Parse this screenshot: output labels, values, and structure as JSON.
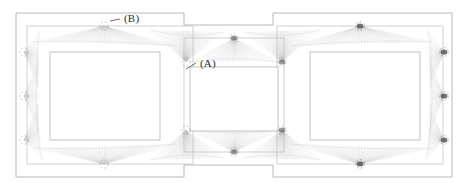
{
  "figure": {
    "type": "plan-diagram",
    "width": 468,
    "height": 192,
    "background_color": "#ffffff",
    "line_color": "#9a9a9a",
    "fan_color": "#8c8c90",
    "node_color": "#4a4a4a",
    "label_color": "#2b2b2b"
  },
  "labels": [
    {
      "id": "A",
      "text": "(A)",
      "x": 200,
      "y": 58,
      "leader_from": [
        196,
        63
      ],
      "leader_to": [
        186,
        69
      ]
    },
    {
      "id": "B",
      "text": "(B)",
      "x": 124,
      "y": 13,
      "leader_from": [
        120,
        19
      ],
      "leader_to": [
        110,
        21
      ]
    }
  ],
  "outline": {
    "name": "outer-boundary",
    "stroke": "#b0b0b0",
    "points": [
      [
        16,
        13
      ],
      [
        184,
        13
      ],
      [
        184,
        25
      ],
      [
        273,
        25
      ],
      [
        273,
        13
      ],
      [
        452,
        13
      ],
      [
        452,
        177
      ],
      [
        273,
        177
      ],
      [
        273,
        165
      ],
      [
        184,
        165
      ],
      [
        184,
        177
      ],
      [
        16,
        177
      ]
    ]
  },
  "bays": [
    {
      "name": "left-bay-outline",
      "x": 27,
      "y": 26,
      "w": 166,
      "h": 138,
      "stroke": "#bcbcbc"
    },
    {
      "name": "center-bay-outline",
      "x": 184,
      "y": 38,
      "w": 100,
      "h": 114,
      "stroke": "#bcbcbc"
    },
    {
      "name": "right-bay-outline",
      "x": 277,
      "y": 26,
      "w": 166,
      "h": 138,
      "stroke": "#bcbcbc"
    }
  ],
  "inner_rectangles": [
    {
      "name": "left-core-rect",
      "x": 50,
      "y": 52,
      "w": 110,
      "h": 88,
      "stroke": "#b4b4b4"
    },
    {
      "name": "center-core-rect",
      "x": 190,
      "y": 67,
      "w": 88,
      "h": 64,
      "stroke": "#b4b4b4"
    },
    {
      "name": "right-core-rect",
      "x": 310,
      "y": 52,
      "w": 110,
      "h": 88,
      "stroke": "#b4b4b4"
    }
  ],
  "nodes": [
    {
      "id": "n-l-top",
      "x": 104,
      "y": 26,
      "marker": "dashed-circle",
      "weight": "light"
    },
    {
      "id": "n-l-bottom",
      "x": 104,
      "y": 164,
      "marker": "dashed-circle",
      "weight": "light"
    },
    {
      "id": "n-l-left-1",
      "x": 24,
      "y": 52,
      "marker": "dashed-circle",
      "weight": "light"
    },
    {
      "id": "n-l-left-2",
      "x": 24,
      "y": 96,
      "marker": "dashed-circle",
      "weight": "light"
    },
    {
      "id": "n-l-left-3",
      "x": 24,
      "y": 140,
      "marker": "dashed-circle",
      "weight": "light"
    },
    {
      "id": "n-l-tr",
      "x": 186,
      "y": 62,
      "marker": "dashed-circle",
      "weight": "light"
    },
    {
      "id": "n-l-br",
      "x": 186,
      "y": 130,
      "marker": "dashed-circle",
      "weight": "light"
    },
    {
      "id": "n-c-top",
      "x": 234,
      "y": 38,
      "marker": "solid-blob",
      "weight": "medium"
    },
    {
      "id": "n-c-bottom",
      "x": 234,
      "y": 152,
      "marker": "solid-blob",
      "weight": "medium"
    },
    {
      "id": "n-c-tr",
      "x": 282,
      "y": 62,
      "marker": "solid-blob",
      "weight": "medium"
    },
    {
      "id": "n-c-br",
      "x": 282,
      "y": 130,
      "marker": "solid-blob",
      "weight": "medium"
    },
    {
      "id": "n-r-top",
      "x": 360,
      "y": 26,
      "marker": "solid-blob",
      "weight": "dark"
    },
    {
      "id": "n-r-bottom",
      "x": 360,
      "y": 164,
      "marker": "solid-blob",
      "weight": "dark"
    },
    {
      "id": "n-r-right-1",
      "x": 444,
      "y": 52,
      "marker": "solid-blob",
      "weight": "dark"
    },
    {
      "id": "n-r-right-2",
      "x": 444,
      "y": 96,
      "marker": "solid-blob",
      "weight": "dark"
    },
    {
      "id": "n-r-right-3",
      "x": 444,
      "y": 140,
      "marker": "solid-blob",
      "weight": "dark"
    }
  ],
  "fans": [
    {
      "name": "fan-left-top",
      "apex": [
        104,
        26
      ],
      "spread_a": [
        34,
        42
      ],
      "spread_b": [
        176,
        46
      ],
      "rays": 46,
      "opacity": 0.5
    },
    {
      "name": "fan-left-bottom",
      "apex": [
        104,
        164
      ],
      "spread_a": [
        34,
        148
      ],
      "spread_b": [
        176,
        144
      ],
      "rays": 46,
      "opacity": 0.5
    },
    {
      "name": "fan-left-edge-1",
      "apex": [
        24,
        52
      ],
      "spread_a": [
        40,
        30
      ],
      "spread_b": [
        38,
        88
      ],
      "rays": 30,
      "opacity": 0.45
    },
    {
      "name": "fan-left-edge-2",
      "apex": [
        24,
        96
      ],
      "spread_a": [
        38,
        60
      ],
      "spread_b": [
        38,
        132
      ],
      "rays": 30,
      "opacity": 0.45
    },
    {
      "name": "fan-left-edge-3",
      "apex": [
        24,
        140
      ],
      "spread_a": [
        38,
        104
      ],
      "spread_b": [
        42,
        160
      ],
      "rays": 30,
      "opacity": 0.45
    },
    {
      "name": "fan-left-tr",
      "apex": [
        186,
        62
      ],
      "spread_a": [
        150,
        30
      ],
      "spread_b": [
        224,
        32
      ],
      "rays": 40,
      "opacity": 0.55
    },
    {
      "name": "fan-left-br",
      "apex": [
        186,
        130
      ],
      "spread_a": [
        150,
        160
      ],
      "spread_b": [
        224,
        158
      ],
      "rays": 40,
      "opacity": 0.55
    },
    {
      "name": "fan-center-top",
      "apex": [
        234,
        38
      ],
      "spread_a": [
        190,
        62
      ],
      "spread_b": [
        280,
        62
      ],
      "rays": 36,
      "opacity": 0.5
    },
    {
      "name": "fan-center-bottom",
      "apex": [
        234,
        152
      ],
      "spread_a": [
        190,
        130
      ],
      "spread_b": [
        280,
        130
      ],
      "rays": 36,
      "opacity": 0.5
    },
    {
      "name": "fan-center-tr",
      "apex": [
        282,
        62
      ],
      "spread_a": [
        244,
        32
      ],
      "spread_b": [
        320,
        30
      ],
      "rays": 40,
      "opacity": 0.55
    },
    {
      "name": "fan-center-br",
      "apex": [
        282,
        130
      ],
      "spread_a": [
        244,
        158
      ],
      "spread_b": [
        320,
        160
      ],
      "rays": 40,
      "opacity": 0.55
    },
    {
      "name": "fan-right-top",
      "apex": [
        360,
        26
      ],
      "spread_a": [
        292,
        46
      ],
      "spread_b": [
        432,
        42
      ],
      "rays": 46,
      "opacity": 0.5
    },
    {
      "name": "fan-right-bottom",
      "apex": [
        360,
        164
      ],
      "spread_a": [
        292,
        144
      ],
      "spread_b": [
        432,
        148
      ],
      "rays": 46,
      "opacity": 0.5
    },
    {
      "name": "fan-right-edge-1",
      "apex": [
        444,
        52
      ],
      "spread_a": [
        428,
        30
      ],
      "spread_b": [
        430,
        88
      ],
      "rays": 30,
      "opacity": 0.48
    },
    {
      "name": "fan-right-edge-2",
      "apex": [
        444,
        96
      ],
      "spread_a": [
        430,
        60
      ],
      "spread_b": [
        430,
        132
      ],
      "rays": 30,
      "opacity": 0.48
    },
    {
      "name": "fan-right-edge-3",
      "apex": [
        444,
        140
      ],
      "spread_a": [
        430,
        104
      ],
      "spread_b": [
        426,
        160
      ],
      "rays": 30,
      "opacity": 0.48
    }
  ]
}
